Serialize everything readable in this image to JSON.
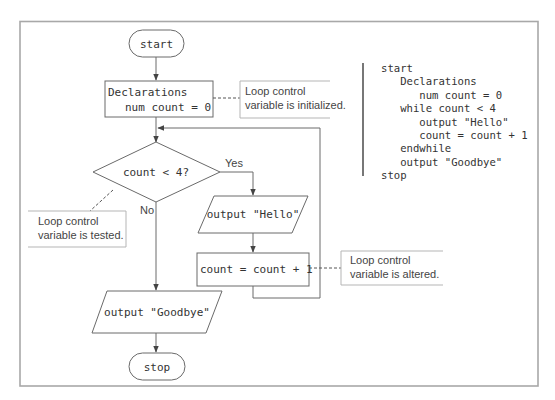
{
  "flowchart": {
    "start_label": "start",
    "declarations": {
      "line1": "Declarations",
      "line2": "num count = 0"
    },
    "decision_label": "count < 4?",
    "yes_label": "Yes",
    "no_label": "No",
    "output_hello": "output \"Hello\"",
    "increment": "count = count + 1",
    "output_goodbye": "output \"Goodbye\"",
    "stop_label": "stop"
  },
  "annotations": {
    "initialized": {
      "line1": "Loop control",
      "line2": "variable is initialized."
    },
    "tested": {
      "line1": "Loop control",
      "line2": "variable is tested."
    },
    "altered": {
      "line1": "Loop control",
      "line2": "variable is altered."
    }
  },
  "pseudocode": {
    "lines": [
      "start",
      "   Declarations",
      "      num count = 0",
      "   while count < 4",
      "      output \"Hello\"",
      "      count = count + 1",
      "   endwhile",
      "   output \"Goodbye\"",
      "stop"
    ]
  }
}
